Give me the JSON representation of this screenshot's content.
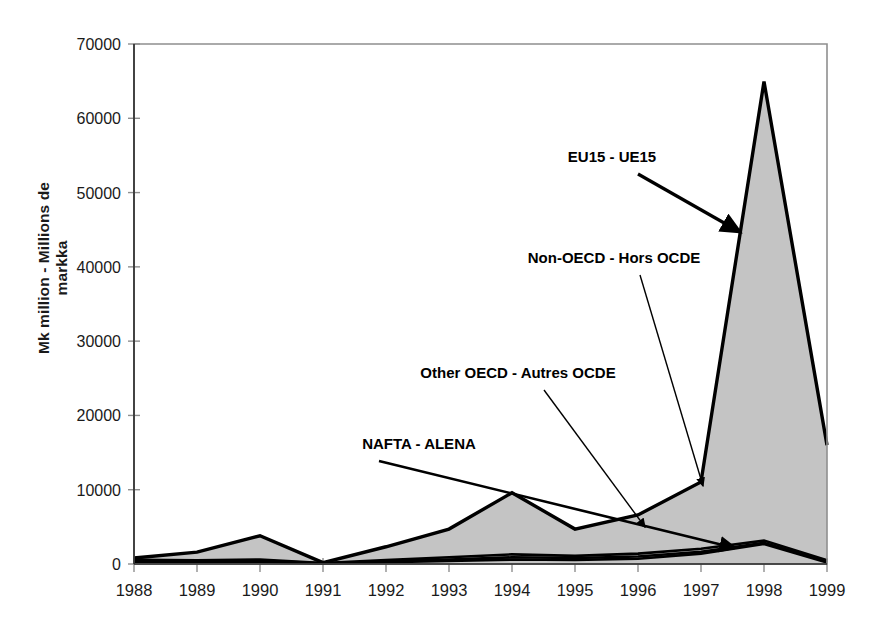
{
  "page": {
    "background": "#ffffff",
    "cropped_header_text": ""
  },
  "chart_data": {
    "type": "area",
    "stacked": true,
    "title": "",
    "subtitle": "",
    "xlabel": "",
    "ylabel": "Mk million - Millions de markka",
    "x": [
      1988,
      1989,
      1990,
      1991,
      1992,
      1993,
      1994,
      1995,
      1996,
      1997,
      1998,
      1999
    ],
    "xtick_labels": [
      "1988",
      "1989",
      "1990",
      "1991",
      "1992",
      "1993",
      "1994",
      "1995",
      "1996",
      "1997",
      "1998",
      "1999"
    ],
    "ylim": [
      0,
      70000
    ],
    "ytick_values": [
      0,
      10000,
      20000,
      30000,
      40000,
      50000,
      60000,
      70000
    ],
    "ytick_labels": [
      "0",
      "10000",
      "20000",
      "30000",
      "40000",
      "50000",
      "60000",
      "70000"
    ],
    "grid": false,
    "legend": "annotated-arrows",
    "area_fill": "#c4c4c4",
    "line_color": "#000000",
    "series": [
      {
        "name": "NAFTA - ALENA",
        "label_en": "NAFTA",
        "label_fr": "ALENA",
        "values": [
          300,
          250,
          300,
          60,
          250,
          400,
          600,
          550,
          700,
          1400,
          2700,
          200
        ]
      },
      {
        "name": "Other OECD - Autres OCDE",
        "label_en": "Other OECD",
        "label_fr": "Autres OCDE",
        "values": [
          150,
          120,
          150,
          30,
          120,
          200,
          300,
          250,
          300,
          250,
          150,
          100
        ]
      },
      {
        "name": "Non-OECD - Hors OCDE",
        "label_en": "Non-OECD",
        "label_fr": "Hors OCDE",
        "values": [
          120,
          130,
          150,
          30,
          150,
          300,
          400,
          300,
          400,
          400,
          300,
          200
        ]
      },
      {
        "name": "EU15 - UE15",
        "label_en": "EU15",
        "label_fr": "UE15",
        "values": [
          230,
          1100,
          3200,
          60,
          1800,
          3800,
          8300,
          3600,
          5200,
          9000,
          61800,
          15500
        ]
      }
    ],
    "series_totals": [
      800,
      1600,
      3800,
      180,
      2320,
      4700,
      9600,
      4700,
      6600,
      11050,
      65000,
      16000
    ],
    "annotations": [
      {
        "text": "EU15 - UE15",
        "target_x": 1998,
        "target_y": 45000
      },
      {
        "text": "Non-OECD - Hors OCDE",
        "target_x": 1997,
        "target_y": 11000
      },
      {
        "text": "Other OECD - Autres OCDE",
        "target_x": 1996,
        "target_y": 6600
      },
      {
        "text": "NAFTA - ALENA",
        "target_x": 1998,
        "target_y": 1900
      }
    ]
  }
}
